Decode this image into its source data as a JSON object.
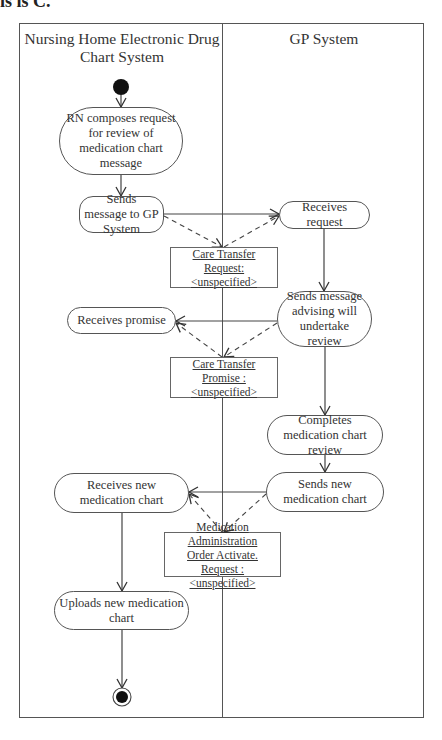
{
  "page": {
    "top_cut_text": "is is C."
  },
  "swimlanes": [
    {
      "id": "nursing_home",
      "title": "Nursing Home Electronic Drug Chart System"
    },
    {
      "id": "gp",
      "title": "GP System"
    }
  ],
  "nodes": {
    "start": {
      "type": "initial"
    },
    "rn_composes": {
      "lane": "nursing_home",
      "label": "RN composes request for review of medication chart message"
    },
    "sends_message": {
      "lane": "nursing_home",
      "label": "Sends message to GP System"
    },
    "receives_request": {
      "lane": "gp",
      "label": "Receives request"
    },
    "sends_advising": {
      "lane": "gp",
      "label": "Sends message advising will undertake review"
    },
    "receives_promise": {
      "lane": "nursing_home",
      "label": "Receives promise"
    },
    "completes_review": {
      "lane": "gp",
      "label": "Completes medication chart review"
    },
    "sends_new_chart": {
      "lane": "gp",
      "label": "Sends new medication chart"
    },
    "receives_new_chart": {
      "lane": "nursing_home",
      "label": "Receives new medication chart"
    },
    "uploads_new_chart": {
      "lane": "nursing_home",
      "label": "Uploads new medication chart"
    },
    "end": {
      "type": "final"
    }
  },
  "objects": {
    "care_transfer_request": {
      "line1": "Care Transfer",
      "line2": "Request: <unspecified>"
    },
    "care_transfer_promise": {
      "line1": "Care Transfer",
      "line2": "Promise : <unspecified>"
    },
    "med_admin_order": {
      "line1": "Medication Administration",
      "line2": "Order Activate.",
      "line3": "Request : <unspecified>"
    }
  },
  "edges": [
    {
      "from": "start",
      "to": "rn_composes",
      "style": "solid"
    },
    {
      "from": "rn_composes",
      "to": "sends_message",
      "style": "solid"
    },
    {
      "from": "sends_message",
      "to": "receives_request",
      "style": "solid"
    },
    {
      "from": "sends_message",
      "to": "care_transfer_request",
      "style": "dashed"
    },
    {
      "from": "care_transfer_request",
      "to": "receives_request",
      "style": "dashed"
    },
    {
      "from": "receives_request",
      "to": "sends_advising",
      "style": "solid"
    },
    {
      "from": "sends_advising",
      "to": "receives_promise",
      "style": "solid"
    },
    {
      "from": "sends_advising",
      "to": "care_transfer_promise",
      "style": "dashed"
    },
    {
      "from": "care_transfer_promise",
      "to": "receives_promise",
      "style": "dashed"
    },
    {
      "from": "sends_advising",
      "to": "completes_review",
      "style": "solid"
    },
    {
      "from": "completes_review",
      "to": "sends_new_chart",
      "style": "solid"
    },
    {
      "from": "sends_new_chart",
      "to": "receives_new_chart",
      "style": "solid"
    },
    {
      "from": "sends_new_chart",
      "to": "med_admin_order",
      "style": "dashed"
    },
    {
      "from": "med_admin_order",
      "to": "receives_new_chart",
      "style": "dashed"
    },
    {
      "from": "receives_new_chart",
      "to": "uploads_new_chart",
      "style": "solid"
    },
    {
      "from": "uploads_new_chart",
      "to": "end",
      "style": "solid"
    }
  ],
  "colors": {
    "line": "#444444",
    "border": "#555555",
    "background": "#ffffff",
    "node_fill": "#111111"
  }
}
